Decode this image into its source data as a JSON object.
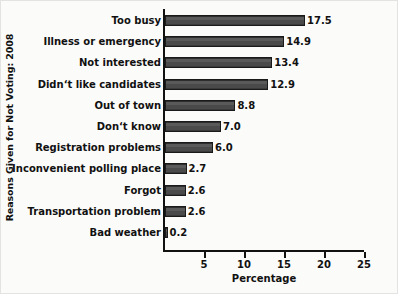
{
  "chart_data": {
    "type": "bar",
    "orientation": "horizontal",
    "title": "",
    "xlabel": "Percentage",
    "ylabel": "Reasons Given for Not Voting: 2008",
    "xlim": [
      0,
      25
    ],
    "xticks": [
      5,
      10,
      15,
      20,
      25
    ],
    "xtick_labels": [
      "5",
      "10",
      "15",
      "20",
      "25"
    ],
    "grid": false,
    "legend": null,
    "bar_color": "#4d4d4d",
    "bar_edge_color": "#1a1a1a",
    "text_color": "#111111",
    "background_color": "#fbfbfa",
    "categories": [
      "Too busy",
      "Illness or emergency",
      "Not interested",
      "Didn‘t like candidates",
      "Out of town",
      "Don‘t know",
      "Registration problems",
      "Inconvenient polling place",
      "Forgot",
      "Transportation problem",
      "Bad weather"
    ],
    "values": [
      17.5,
      14.9,
      13.4,
      12.9,
      8.8,
      7.0,
      6.0,
      2.7,
      2.6,
      2.6,
      0.2
    ],
    "value_labels": [
      "17.5",
      "14.9",
      "13.4",
      "12.9",
      "8.8",
      "7.0",
      "6.0",
      "2.7",
      "2.6",
      "2.6",
      "0.2"
    ]
  }
}
